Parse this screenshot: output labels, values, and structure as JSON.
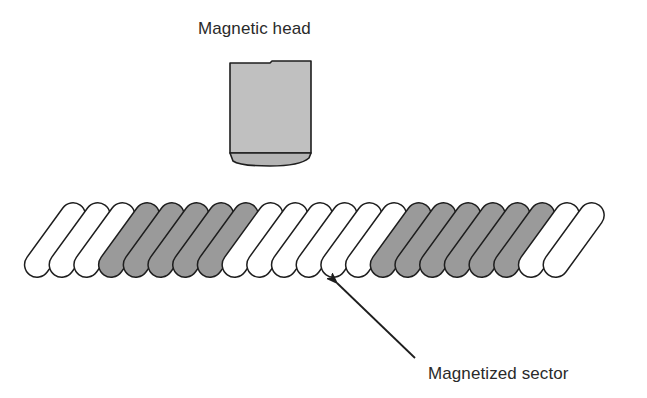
{
  "diagram": {
    "labels": {
      "head": "Magnetic head",
      "sector": "Magnetized sector"
    },
    "colors": {
      "head_fill": "#c0c0c0",
      "head_tip_fill": "#b4b4b4",
      "stroke": "#1e1e1e",
      "magnetized_fill": "#9a9a9a",
      "unmagnetized_fill": "#ffffff",
      "text": "#2a2a2a"
    },
    "head": {
      "x": 230,
      "y": 62,
      "width": 81,
      "body_bottom": 153,
      "tip_bottom": 165
    },
    "strip": {
      "pill_count": 22,
      "pattern": [
        "white",
        "white",
        "white",
        "gray",
        "gray",
        "gray",
        "gray",
        "gray",
        "white",
        "white",
        "white",
        "white",
        "white",
        "white",
        "gray",
        "gray",
        "gray",
        "gray",
        "gray",
        "gray",
        "white",
        "white"
      ],
      "groups": [
        {
          "state": "unmagnetized",
          "count": 3
        },
        {
          "state": "magnetized",
          "count": 5
        },
        {
          "state": "unmagnetized",
          "count": 6
        },
        {
          "state": "magnetized",
          "count": 6
        },
        {
          "state": "unmagnetized",
          "count": 2
        }
      ],
      "first_center_x": 55,
      "center_y": 240,
      "spacing": 24.7,
      "pill_width": 25,
      "pill_length": 86,
      "tilt_deg": 36
    },
    "arrow": {
      "tip": [
        337,
        283
      ],
      "tail": [
        415,
        358
      ],
      "points_to_pill_index": 12
    }
  }
}
